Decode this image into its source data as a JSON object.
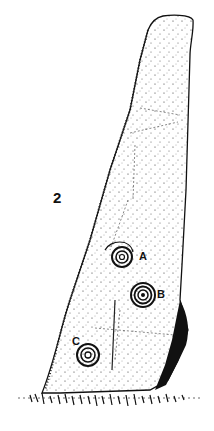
{
  "figure": {
    "number": "2",
    "markings": [
      {
        "label": "A",
        "cx": 122,
        "cy": 257,
        "rings": 3
      },
      {
        "label": "B",
        "cx": 143,
        "cy": 295,
        "rings": 4
      },
      {
        "label": "C",
        "cx": 88,
        "cy": 355,
        "rings": 3
      }
    ],
    "colors": {
      "ink": "#111111",
      "paper": "#ffffff"
    }
  }
}
